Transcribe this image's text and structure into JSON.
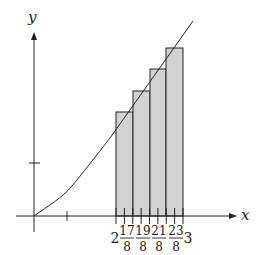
{
  "figure": {
    "axes": {
      "x_label": "x",
      "y_label": "y",
      "origin_px": [
        34,
        216
      ]
    },
    "colors": {
      "stroke": "#222222",
      "rect_fill": "#d2d2d2",
      "background": "#ffffff"
    },
    "tick_labels": [
      {
        "type": "whole",
        "text": "2",
        "x": 115
      },
      {
        "type": "frac",
        "num": "17",
        "den": "8",
        "x": 127
      },
      {
        "type": "frac",
        "num": "19",
        "den": "8",
        "x": 143
      },
      {
        "type": "frac",
        "num": "21",
        "den": "8",
        "x": 159
      },
      {
        "type": "frac",
        "num": "23",
        "den": "8",
        "x": 176
      },
      {
        "type": "whole",
        "text": "3",
        "x": 188
      }
    ],
    "rectangles": [
      {
        "x_from": "2",
        "x_to": "9/4",
        "sample_point": "17/8",
        "px": [
          116,
          112,
          17,
          104
        ]
      },
      {
        "x_from": "9/4",
        "x_to": "5/2",
        "sample_point": "19/8",
        "px": [
          133,
          91,
          17,
          125
        ]
      },
      {
        "x_from": "5/2",
        "x_to": "11/4",
        "sample_point": "21/8",
        "px": [
          150,
          69,
          16,
          147
        ]
      },
      {
        "x_from": "11/4",
        "x_to": "3",
        "sample_point": "23/8",
        "px": [
          166,
          48,
          17,
          168
        ]
      }
    ]
  }
}
